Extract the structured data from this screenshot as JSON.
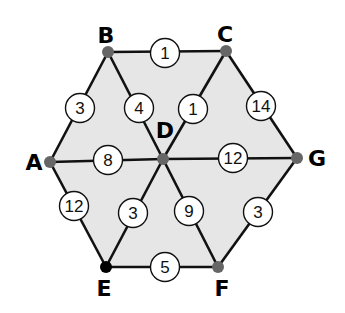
{
  "colors": {
    "fill": "#e6e6e6",
    "edge": "#111111",
    "node": "#666666",
    "node_e": "#000000"
  },
  "nodes": [
    {
      "id": "A",
      "x": 50,
      "y": 162,
      "lx": 34,
      "ly": 170
    },
    {
      "id": "B",
      "x": 108,
      "y": 52,
      "lx": 106,
      "ly": 43
    },
    {
      "id": "C",
      "x": 226,
      "y": 51,
      "lx": 225,
      "ly": 42
    },
    {
      "id": "D",
      "x": 163,
      "y": 159,
      "lx": 165,
      "ly": 138
    },
    {
      "id": "G",
      "x": 297,
      "y": 158,
      "lx": 317,
      "ly": 166
    },
    {
      "id": "E",
      "x": 106,
      "y": 267,
      "lx": 104,
      "ly": 296
    },
    {
      "id": "F",
      "x": 218,
      "y": 267,
      "lx": 222,
      "ly": 296
    }
  ],
  "edges": [
    {
      "from": "B",
      "to": "C",
      "weight": "1",
      "wx": 165,
      "wy": 53
    },
    {
      "from": "A",
      "to": "B",
      "weight": "3",
      "wx": 80,
      "wy": 108
    },
    {
      "from": "B",
      "to": "D",
      "weight": "4",
      "wx": 139,
      "wy": 108
    },
    {
      "from": "C",
      "to": "D",
      "weight": "1",
      "wx": 193,
      "wy": 109
    },
    {
      "from": "C",
      "to": "G",
      "weight": "14",
      "wx": 261,
      "wy": 106
    },
    {
      "from": "A",
      "to": "D",
      "weight": "8",
      "wx": 108,
      "wy": 160
    },
    {
      "from": "D",
      "to": "G",
      "weight": "12",
      "wx": 233,
      "wy": 158
    },
    {
      "from": "A",
      "to": "E",
      "weight": "12",
      "wx": 74,
      "wy": 206
    },
    {
      "from": "D",
      "to": "E",
      "weight": "3",
      "wx": 133,
      "wy": 213
    },
    {
      "from": "D",
      "to": "F",
      "weight": "9",
      "wx": 189,
      "wy": 211
    },
    {
      "from": "G",
      "to": "F",
      "weight": "3",
      "wx": 258,
      "wy": 212
    },
    {
      "from": "E",
      "to": "F",
      "weight": "5",
      "wx": 165,
      "wy": 267
    }
  ]
}
